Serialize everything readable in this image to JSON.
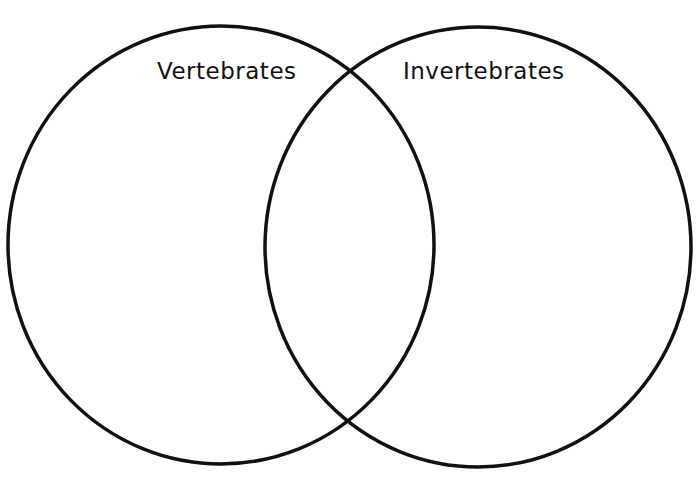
{
  "diagram": {
    "type": "venn",
    "sets": [
      {
        "label": "Vertebrates",
        "cx": 221,
        "cy": 245,
        "rx": 213,
        "ry": 219
      },
      {
        "label": "Invertebrates",
        "cx": 478,
        "cy": 247,
        "rx": 213,
        "ry": 220
      }
    ],
    "stroke_color": "#111111",
    "background": "#ffffff"
  }
}
